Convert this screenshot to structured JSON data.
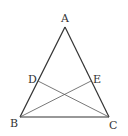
{
  "diagram": {
    "type": "isosceles-triangle-with-cevians",
    "points": {
      "A": {
        "label": "A",
        "x": 65,
        "y": 27,
        "lx": 61,
        "ly": 22
      },
      "B": {
        "label": "B",
        "x": 20,
        "y": 117,
        "lx": 10,
        "ly": 127
      },
      "C": {
        "label": "C",
        "x": 109,
        "y": 117,
        "lx": 109,
        "ly": 129
      },
      "D": {
        "label": "D",
        "x": 38,
        "y": 81,
        "lx": 28,
        "ly": 83
      },
      "E": {
        "label": "E",
        "x": 91,
        "y": 81,
        "lx": 93,
        "ly": 83
      }
    },
    "segments": [
      [
        "A",
        "B"
      ],
      [
        "A",
        "C"
      ],
      [
        "B",
        "C"
      ],
      [
        "D",
        "C"
      ],
      [
        "B",
        "E"
      ]
    ],
    "colors": {
      "stroke": "#333333",
      "thin_stroke": "#555555"
    }
  }
}
